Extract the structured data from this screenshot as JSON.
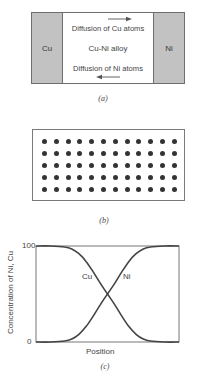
{
  "panel_a": {
    "left_block_label": "Cu",
    "right_block_label": "Ni",
    "center_label": "Cu-Ni alloy",
    "top_flow_label": "Diffusion of Cu atoms",
    "top_flow_direction": "right",
    "bottom_flow_label": "Diffusion of Ni atoms",
    "bottom_flow_direction": "left",
    "block_color": "#c2c2c2",
    "caption": "(a)"
  },
  "panel_b": {
    "grid_rows": 5,
    "grid_cols": 12,
    "dot_color": "#333333",
    "caption": "(b)"
  },
  "panel_c": {
    "caption": "(c)"
  },
  "chart_data": {
    "type": "line",
    "title": "",
    "xlabel": "Position",
    "ylabel": "Concentration of Ni, Cu",
    "y_ticks": [
      "0",
      "100"
    ],
    "ylim": [
      0,
      100
    ],
    "grid": false,
    "legend": "inline labels near curves",
    "x": [
      0,
      0.1,
      0.2,
      0.25,
      0.3,
      0.35,
      0.4,
      0.45,
      0.5,
      0.55,
      0.6,
      0.65,
      0.7,
      0.75,
      0.8,
      0.9,
      1.0
    ],
    "series": [
      {
        "name": "Cu",
        "values": [
          100,
          100,
          99,
          97,
          92,
          84,
          73,
          61,
          50,
          39,
          27,
          16,
          8,
          3,
          1,
          0,
          0
        ]
      },
      {
        "name": "Ni",
        "values": [
          0,
          0,
          1,
          3,
          8,
          16,
          27,
          39,
          50,
          61,
          73,
          84,
          92,
          97,
          99,
          100,
          100
        ]
      }
    ],
    "series_labels": {
      "Cu": "Cu",
      "Ni": "Ni"
    },
    "line_color": "#444444"
  }
}
